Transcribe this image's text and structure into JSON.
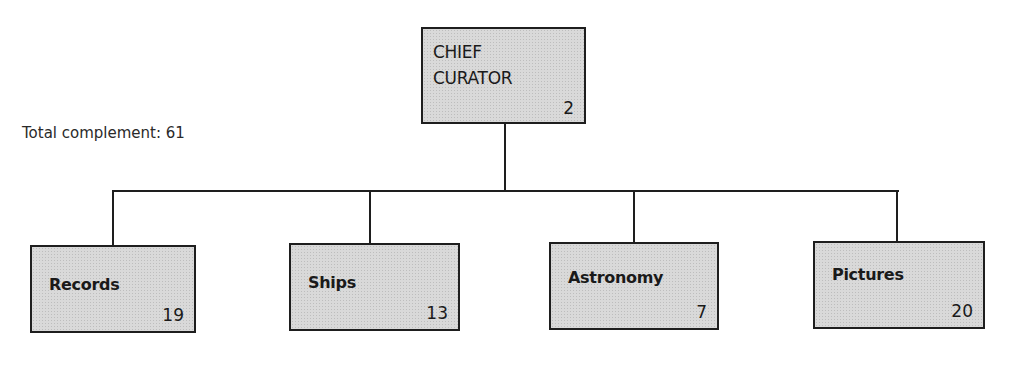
{
  "note": "Total complement: 61",
  "chief": {
    "title_line1": "CHIEF",
    "title_line2": "CURATOR",
    "count": "2"
  },
  "departments": [
    {
      "name": "Records",
      "count": "19"
    },
    {
      "name": "Ships",
      "count": "13"
    },
    {
      "name": "Astronomy",
      "count": "7"
    },
    {
      "name": "Pictures",
      "count": "20"
    }
  ]
}
